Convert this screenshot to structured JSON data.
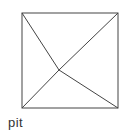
{
  "diagram": {
    "label": "pit",
    "stroke_color": "#444444",
    "square": {
      "x1": 22,
      "y1": 13,
      "x2": 118,
      "y2": 108
    },
    "apex": {
      "x": 59,
      "y": 70
    }
  }
}
